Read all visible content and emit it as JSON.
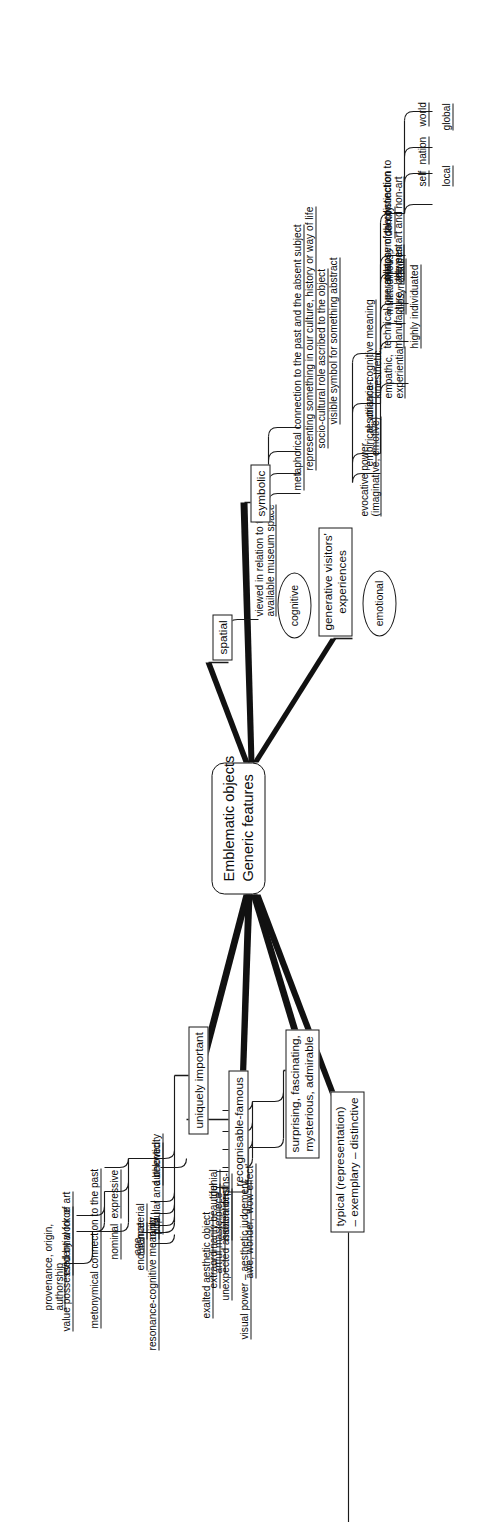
{
  "diagram": {
    "type": "mind-map",
    "orientation": "rotated-90-ccw",
    "central": {
      "line1": "Emblematic objects",
      "line2": "Generic features"
    },
    "branches": [
      {
        "id": "uniquely-important",
        "label": "uniquely important",
        "children": [
          {
            "id": "age",
            "label": "age"
          },
          {
            "id": "authenticity",
            "label": "authenticity",
            "children": [
              {
                "id": "nominal",
                "label": "nominal",
                "children": [
                  {
                    "id": "provenance",
                    "line1": "provenance, origin,",
                    "line2": "authorship"
                  }
                ]
              },
              {
                "id": "expressive",
                "label": "expressive",
                "children": [
                  {
                    "id": "value-possessed",
                    "label": "value possessed by work of art"
                  },
                  {
                    "id": "evidential-force",
                    "label": "evidential force"
                  }
                ]
              },
              {
                "id": "metonymical-past",
                "label": "metonymical connection to the past"
              }
            ]
          },
          {
            "id": "material",
            "label": "material"
          },
          {
            "id": "rarity",
            "label": "rarity"
          },
          {
            "id": "endurance",
            "label": "endurance"
          },
          {
            "id": "resonance-cognitive",
            "label": "resonance-cognitive meaning"
          }
        ]
      },
      {
        "id": "recognisable-famous",
        "label": "recognisable-famous",
        "children": [
          {
            "id": "popular-beloved",
            "label": "popular and beloved"
          }
        ]
      },
      {
        "id": "surprising-group",
        "line1": "surprising, fascinating,",
        "line2": "mysterious, admirable",
        "children": [
          {
            "id": "visual-power",
            "label": "visual power – aesthetic judgement",
            "children": [
              {
                "id": "exalted",
                "label": "exalted aesthetic object"
              },
              {
                "id": "artful-masterpiece",
                "label": "artful masterpiece"
              }
            ]
          },
          {
            "id": "awe-wonder",
            "label": "awe, wonder, 'wow effect'",
            "children": [
              {
                "id": "genial",
                "label": "genial"
              },
              {
                "id": "extraordinarily-beautiful",
                "label": "extraordinarily beautiful"
              },
              {
                "id": "hidden-depths",
                "label": "hidden depths-"
              },
              {
                "id": "unexpected-associations",
                "label": "unexpected associations"
              }
            ]
          }
        ]
      },
      {
        "id": "typical",
        "line1": "typical (representation)",
        "line2": "– exemplary – distinctive",
        "children": []
      },
      {
        "id": "symbolic",
        "label": "symbolic",
        "children": [
          {
            "id": "metaphorical-absent",
            "label": "metaphorical connection to the past and the absent subject"
          },
          {
            "id": "representing-culture",
            "label": "representing something in our culture, history or way of life"
          },
          {
            "id": "socio-cultural-role",
            "label": "socio-cultural role ascribed to the object"
          },
          {
            "id": "visible-symbol",
            "label": "visible symbol for something abstract"
          }
        ]
      },
      {
        "id": "spatial",
        "label": "spatial",
        "children": [
          {
            "id": "museum-space",
            "line1": "viewed in relation to the",
            "line2": "available museum space"
          }
        ]
      },
      {
        "id": "generative-visitors-experiences",
        "line1": "generative visitors'",
        "line2": "experiences",
        "bubbles": [
          {
            "id": "cognitive",
            "label": "cognitive"
          },
          {
            "id": "emotional",
            "label": "emotional"
          }
        ],
        "children": [
          {
            "id": "evocative-power",
            "line1": "evocative power",
            "line2": "(imaginative, emotive)",
            "children": [
              {
                "id": "multitudinous",
                "line1": "multitudinous,",
                "line2": "idiosyncratic"
              },
              {
                "id": "highly-individuated",
                "label": "highly individuated"
              },
              {
                "id": "kinesthetic",
                "line1": "kinesthetic,",
                "line2": "empathic,",
                "line3": "experiential"
              }
            ]
          },
          {
            "id": "empirical-utilitarian",
            "label": "empirical, utilitarian",
            "children": [
              {
                "id": "technical-operation",
                "line1": "technical operation,",
                "line2": "manufacture"
              },
              {
                "id": "collapse-distinction",
                "line1": "collapse of the distinction",
                "line2": "between art and non-art"
              }
            ]
          },
          {
            "id": "resonance-cognitive-meaning-2",
            "label": "resonance-cognitive meaning",
            "children": [
              {
                "id": "metonymical-past-2",
                "line1": "metonymical connection to",
                "line2": "the past"
              },
              {
                "id": "identity",
                "label": "identity",
                "children": [
                  {
                    "id": "self",
                    "label": "self"
                  },
                  {
                    "id": "nation",
                    "label": "nation"
                  },
                  {
                    "id": "world",
                    "label": "world"
                  },
                  {
                    "id": "local",
                    "label": "local"
                  },
                  {
                    "id": "global",
                    "label": "global"
                  }
                ]
              }
            ]
          }
        ]
      }
    ]
  },
  "colors": {
    "ink": "#111111",
    "background": "#ffffff"
  }
}
